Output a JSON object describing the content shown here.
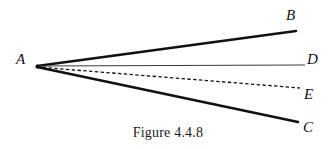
{
  "figure": {
    "caption": "Figure 4.4.8",
    "background_color": "#ffffff",
    "width": 336,
    "height": 149,
    "vertex": {
      "name": "A",
      "x": 37,
      "y": 66
    },
    "labels": {
      "A": "A",
      "B": "B",
      "C": "C",
      "D": "D",
      "E": "E"
    },
    "rays": [
      {
        "name": "ray-AB",
        "from": "A",
        "to": "B",
        "x1": 37,
        "y1": 66,
        "x2": 296,
        "y2": 31,
        "style": "solid",
        "stroke_width": 2.6,
        "color": "#111111"
      },
      {
        "name": "ray-AD",
        "from": "A",
        "to": "D",
        "x1": 37,
        "y1": 66,
        "x2": 305,
        "y2": 65,
        "style": "solid",
        "stroke_width": 1.1,
        "color": "#3a3a3a"
      },
      {
        "name": "ray-AE",
        "from": "A",
        "to": "E",
        "x1": 37,
        "y1": 67,
        "x2": 300,
        "y2": 88,
        "style": "dashed",
        "dash_pattern": "3.4,2.4",
        "stroke_width": 1.3,
        "color": "#111111"
      },
      {
        "name": "ray-AC",
        "from": "A",
        "to": "C",
        "x1": 37,
        "y1": 67,
        "x2": 298,
        "y2": 122,
        "style": "solid",
        "stroke_width": 2.6,
        "color": "#111111"
      }
    ]
  }
}
